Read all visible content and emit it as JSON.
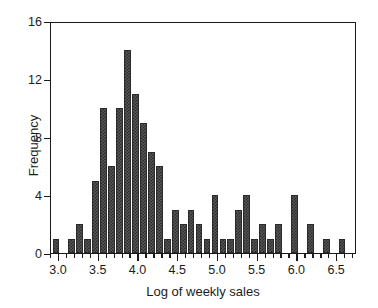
{
  "chart_data": {
    "type": "bar",
    "title": "",
    "xlabel": "Log of weekly sales",
    "ylabel": "Frequency",
    "xlim": [
      2.9,
      6.75
    ],
    "ylim": [
      0,
      16
    ],
    "bin_width": 0.1,
    "grid": false,
    "legend": null,
    "xticks": [
      3.0,
      3.5,
      4.0,
      4.5,
      5.0,
      5.5,
      6.0,
      6.5
    ],
    "xticklabels": [
      "3.0",
      "3.5",
      "4.0",
      "4.5",
      "5.0",
      "5.5",
      "6.0",
      "6.5"
    ],
    "xminor_tick_step": 0.1,
    "yticks": [
      0,
      4,
      8,
      12,
      16
    ],
    "yticklabels": [
      "0",
      "4",
      "8",
      "12",
      "16"
    ],
    "bar_color": "#4a4a4a",
    "bar_edge_color": "#2a2a2a",
    "axis_color": "#1a1a1a",
    "background_color": "#ffffff",
    "categories": [
      "2.95",
      "3.05",
      "3.15",
      "3.25",
      "3.35",
      "3.45",
      "3.55",
      "3.65",
      "3.75",
      "3.85",
      "3.95",
      "4.05",
      "4.15",
      "4.25",
      "4.35",
      "4.45",
      "4.55",
      "4.65",
      "4.75",
      "4.85",
      "4.95",
      "5.05",
      "5.15",
      "5.25",
      "5.35",
      "5.45",
      "5.55",
      "5.65",
      "5.75",
      "5.85",
      "5.95",
      "6.05",
      "6.15",
      "6.25",
      "6.35",
      "6.45",
      "6.55",
      "6.65"
    ],
    "values": [
      1,
      0,
      1,
      2,
      1,
      5,
      10,
      6,
      10,
      14,
      11,
      9,
      7,
      6,
      1,
      3,
      2,
      3,
      2,
      1,
      4,
      1,
      1,
      3,
      4,
      1,
      2,
      1,
      2,
      0,
      4,
      0,
      2,
      0,
      1,
      0,
      1,
      0
    ],
    "bin_lefts": [
      2.92,
      3.02,
      3.12,
      3.22,
      3.32,
      3.42,
      3.52,
      3.62,
      3.72,
      3.82,
      3.92,
      4.02,
      4.12,
      4.22,
      4.32,
      4.42,
      4.52,
      4.62,
      4.72,
      4.82,
      4.92,
      5.02,
      5.12,
      5.22,
      5.32,
      5.42,
      5.52,
      5.62,
      5.72,
      5.82,
      5.92,
      6.02,
      6.12,
      6.22,
      6.32,
      6.42,
      6.52,
      6.62
    ]
  }
}
